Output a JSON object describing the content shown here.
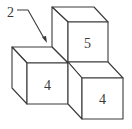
{
  "diagram": {
    "type": "isometric-cube-arrangement",
    "callout": {
      "label": "2"
    },
    "cubes": [
      {
        "id": "top-back",
        "label": "5"
      },
      {
        "id": "front-left",
        "label": "4"
      },
      {
        "id": "front-right",
        "label": "4"
      }
    ],
    "colors": {
      "stroke": "#3a3a3a",
      "background": "#ffffff"
    }
  }
}
